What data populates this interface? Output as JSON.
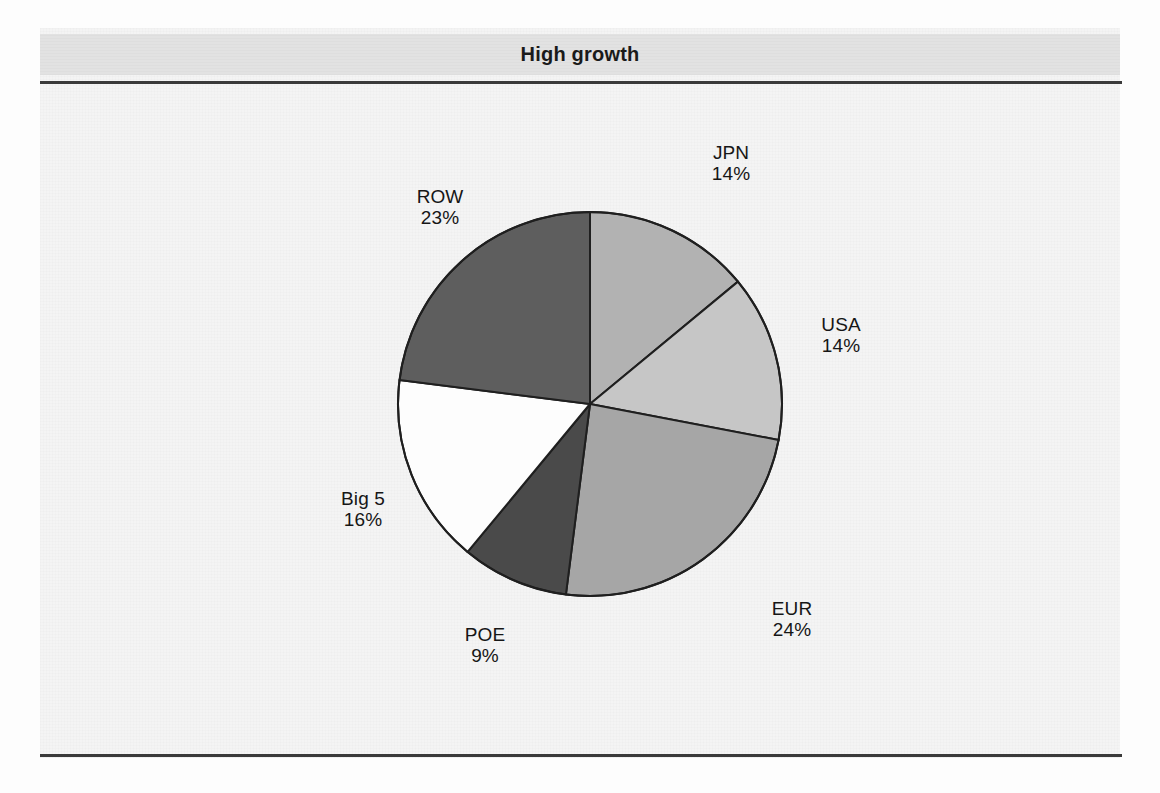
{
  "page": {
    "title": "High growth",
    "background_color": "#f4f4f4",
    "band_color": "#e2e2e2",
    "rule_color": "#3a3a3a"
  },
  "chart_data": {
    "type": "pie",
    "title": "High growth",
    "subtitle": "",
    "xlabel": "",
    "ylabel": "",
    "legend_position": "none",
    "grid": false,
    "start_angle_deg": 0,
    "direction": "clockwise",
    "units": "percent",
    "categories": [
      "JPN",
      "USA",
      "EUR",
      "POE",
      "Big 5",
      "ROW"
    ],
    "values": [
      14,
      14,
      24,
      9,
      16,
      23
    ],
    "labels": [
      "JPN",
      "USA",
      "EUR",
      "POE",
      "Big 5",
      "ROW"
    ],
    "value_labels": [
      "14%",
      "14%",
      "24%",
      "9%",
      "16%",
      "23%"
    ],
    "colors": [
      "#b2b2b2",
      "#c6c6c6",
      "#a6a6a6",
      "#4a4a4a",
      "#fdfdfd",
      "#5e5e5e"
    ],
    "slice_edge_color": "#1f1f1f",
    "slices": [
      {
        "name": "JPN",
        "value": 14,
        "value_label": "14%",
        "color": "#b2b2b2"
      },
      {
        "name": "USA",
        "value": 14,
        "value_label": "14%",
        "color": "#c6c6c6"
      },
      {
        "name": "EUR",
        "value": 24,
        "value_label": "24%",
        "color": "#a6a6a6"
      },
      {
        "name": "POE",
        "value": 9,
        "value_label": "9%",
        "color": "#4a4a4a"
      },
      {
        "name": "Big 5",
        "value": 16,
        "value_label": "16%",
        "color": "#fdfdfd"
      },
      {
        "name": "ROW",
        "value": 23,
        "value_label": "23%",
        "color": "#5e5e5e"
      }
    ]
  }
}
